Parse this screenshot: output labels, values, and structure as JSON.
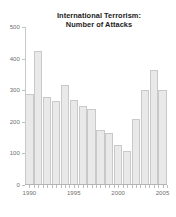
{
  "chart_data": {
    "type": "bar",
    "title": "International Terrorism:\nNumber of Attacks",
    "title_lines": [
      "International Terrorism:",
      "Number of Attacks"
    ],
    "xlabel": "",
    "ylabel": "",
    "categories": [
      1990,
      1991,
      1992,
      1993,
      1994,
      1995,
      1996,
      1997,
      1998,
      1999,
      2000,
      2001,
      2002,
      2003,
      2004,
      2005
    ],
    "values": [
      285,
      420,
      275,
      262,
      312,
      267,
      248,
      237,
      172,
      163,
      124,
      103,
      205,
      296,
      361,
      298
    ],
    "series": [
      {
        "name": "Number of Attacks",
        "values": [
          285,
          420,
          275,
          262,
          312,
          267,
          248,
          237,
          172,
          163,
          124,
          103,
          205,
          296,
          361,
          298
        ]
      }
    ],
    "ylim": [
      0,
      500
    ],
    "yticks": [
      0,
      100,
      200,
      300,
      400,
      500
    ],
    "ytick_labels": [
      "0",
      "100",
      "200",
      "300",
      "400",
      "500"
    ],
    "xlim": [
      1989.5,
      2005.5
    ],
    "xtick_labels": [
      "1990",
      "1995",
      "2000",
      "2005"
    ],
    "xticks_major": [
      1990,
      1995,
      2000,
      2005
    ],
    "grid": false,
    "legend": "none",
    "bar_color": "#e9e9e9",
    "bar_edge_color": "#c9c9c9",
    "axis_color": "#c0c0c0",
    "text_color": "#6e6e6e",
    "title_color": "#1c1c1c",
    "background": "#ffffff"
  }
}
